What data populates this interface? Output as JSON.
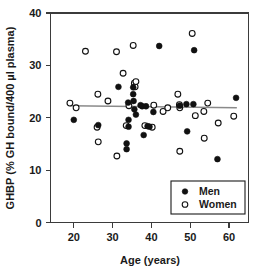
{
  "chart_data": {
    "type": "scatter",
    "title": "",
    "xlabel": "Age (years)",
    "ylabel": "GHBP (% GH bound/400 µl plasma)",
    "xlim": [
      14,
      65
    ],
    "ylim": [
      0,
      40
    ],
    "xticks": [
      20,
      30,
      40,
      50,
      60
    ],
    "yticks": [
      0,
      10,
      20,
      30,
      40
    ],
    "xtick_labels": [
      "20",
      "30",
      "40",
      "50",
      "60"
    ],
    "ytick_labels": [
      "0",
      "10",
      "20",
      "30",
      "40"
    ],
    "grid": false,
    "legend_position": "bottom-right",
    "legend": [
      {
        "name": "Men",
        "marker": "filled-circle",
        "color": "#111111"
      },
      {
        "name": "Women",
        "marker": "open-circle",
        "color": "#ffffff"
      }
    ],
    "series": [
      {
        "name": "Men",
        "marker": "filled-circle",
        "points": [
          [
            20.0,
            19.6
          ],
          [
            26.3,
            18.6
          ],
          [
            31.5,
            25.9
          ],
          [
            33.6,
            15.1
          ],
          [
            33.6,
            14.0
          ],
          [
            34.0,
            22.9
          ],
          [
            34.1,
            19.6
          ],
          [
            34.1,
            18.3
          ],
          [
            35.3,
            25.8
          ],
          [
            35.3,
            24.5
          ],
          [
            35.4,
            23.2
          ],
          [
            35.6,
            21.6
          ],
          [
            36.0,
            20.6
          ],
          [
            37.2,
            22.4
          ],
          [
            37.6,
            22.2
          ],
          [
            38.0,
            16.7
          ],
          [
            38.6,
            22.2
          ],
          [
            39.0,
            18.4
          ],
          [
            39.5,
            18.3
          ],
          [
            40.5,
            21.1
          ],
          [
            42.0,
            33.7
          ],
          [
            47.3,
            22.3
          ],
          [
            49.0,
            22.6
          ],
          [
            49.2,
            17.4
          ],
          [
            50.8,
            22.6
          ],
          [
            51.0,
            32.9
          ],
          [
            57.0,
            12.1
          ],
          [
            61.8,
            23.8
          ]
        ]
      },
      {
        "name": "Women",
        "marker": "open-circle",
        "points": [
          [
            19.0,
            22.8
          ],
          [
            20.6,
            21.9
          ],
          [
            23.0,
            32.7
          ],
          [
            26.0,
            18.2
          ],
          [
            26.2,
            24.5
          ],
          [
            26.3,
            15.4
          ],
          [
            28.8,
            23.2
          ],
          [
            31.0,
            32.6
          ],
          [
            31.1,
            12.7
          ],
          [
            32.7,
            28.5
          ],
          [
            33.5,
            18.5
          ],
          [
            34.2,
            22.3
          ],
          [
            35.3,
            33.8
          ],
          [
            35.6,
            26.6
          ],
          [
            35.8,
            25.9
          ],
          [
            36.0,
            26.9
          ],
          [
            38.3,
            18.5
          ],
          [
            40.2,
            18.2
          ],
          [
            40.6,
            22.4
          ],
          [
            43.0,
            21.2
          ],
          [
            44.2,
            21.9
          ],
          [
            46.8,
            24.5
          ],
          [
            47.2,
            22.5
          ],
          [
            47.3,
            21.9
          ],
          [
            47.3,
            13.6
          ],
          [
            50.5,
            36.1
          ],
          [
            51.3,
            20.4
          ],
          [
            53.5,
            21.2
          ],
          [
            53.6,
            16.1
          ],
          [
            54.5,
            22.8
          ],
          [
            57.2,
            19.0
          ],
          [
            61.2,
            20.3
          ]
        ]
      }
    ],
    "trendline": {
      "label": "regression",
      "color": "#8a8a8a",
      "x": [
        19.0,
        62.0
      ],
      "y": [
        22.3,
        21.9
      ]
    }
  }
}
